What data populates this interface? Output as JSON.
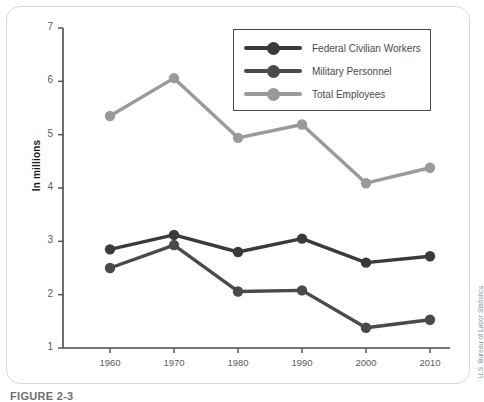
{
  "figure": {
    "source_note": "U.S. Bureau of Labor Statistics",
    "caption": "FIGURE 2-3",
    "frame_color": "#d8d8d8"
  },
  "legend": {
    "position": "top-right",
    "entries": [
      {
        "label": "Federal Civilian Workers",
        "color": "#3a3a3a"
      },
      {
        "label": "Military Personnel",
        "color": "#4a4a4a"
      },
      {
        "label": "Total Employees",
        "color": "#9a9a9a"
      }
    ]
  },
  "chart_data": {
    "type": "line",
    "title": "",
    "xlabel": "",
    "ylabel": "In millions",
    "x": [
      1960,
      1970,
      1980,
      1990,
      2000,
      2010
    ],
    "categories": [
      "1960",
      "1970",
      "1980",
      "1990",
      "2000",
      "2010"
    ],
    "xlim": [
      1955,
      2015
    ],
    "ylim": [
      1,
      7
    ],
    "yticks": [
      1,
      2,
      3,
      4,
      5,
      6,
      7
    ],
    "ytick_labels": [
      "1",
      "2",
      "3",
      "4",
      "5",
      "6",
      "7"
    ],
    "xticks": [
      1960,
      1970,
      1980,
      1990,
      2000,
      2010
    ],
    "grid": false,
    "marker": "circle",
    "series": [
      {
        "name": "Federal Civilian Workers",
        "color": "#3a3a3a",
        "values": [
          2.85,
          3.12,
          2.8,
          3.05,
          2.6,
          2.72
        ]
      },
      {
        "name": "Military Personnel",
        "color": "#4a4a4a",
        "values": [
          2.5,
          2.93,
          2.06,
          2.08,
          1.38,
          1.53
        ]
      },
      {
        "name": "Total Employees",
        "color": "#9a9a9a",
        "values": [
          5.35,
          6.06,
          4.94,
          5.19,
          4.09,
          4.38
        ]
      }
    ]
  }
}
